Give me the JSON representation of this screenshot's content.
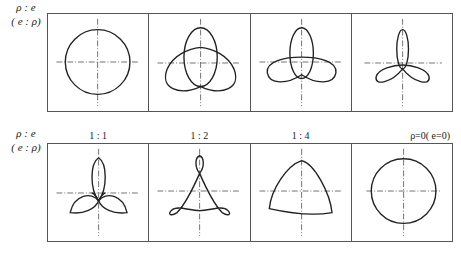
{
  "row1": {
    "label_line1": "ρ : e",
    "label_line2": "( e : ρ)",
    "panels": [
      {
        "shape": "circle"
      },
      {
        "shape": "trefoil-wide"
      },
      {
        "shape": "trefoil-medium"
      },
      {
        "shape": "trefoil-narrow"
      }
    ]
  },
  "row2": {
    "label_line1": "ρ : e",
    "label_line2": "( e : ρ)",
    "panels": [
      {
        "title": "1 : 1",
        "shape": "trefoil-petals"
      },
      {
        "title": "1 : 2",
        "shape": "deltoid-loops"
      },
      {
        "title": "1 : 4",
        "shape": "curved-triangle"
      },
      {
        "title": "ρ=0( e=0)",
        "shape": "circle"
      }
    ]
  },
  "colors": {
    "line": "#222222",
    "frame": "#555555"
  }
}
